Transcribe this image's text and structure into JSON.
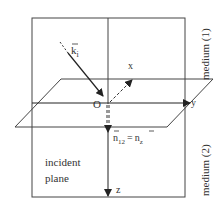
{
  "diagram": {
    "labels": {
      "k_vector": "k",
      "k_subscript": "i",
      "origin": "O",
      "x_axis": "x",
      "y_axis": "y",
      "z_axis": "z",
      "normal_n": "n",
      "normal_sub_12": "12",
      "equals": "=",
      "normal_n2": "n",
      "normal_sub_z": "z",
      "incident_line1": "incident",
      "incident_line2": "plane",
      "medium1": "medium (1)",
      "medium2": "medium (2)"
    },
    "colors": {
      "line": "#333333",
      "background": "#ffffff"
    }
  }
}
